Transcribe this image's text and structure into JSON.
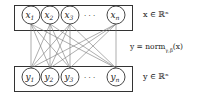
{
  "diagram": {
    "input_layer": {
      "nodes": [
        {
          "label": "x",
          "sub": "1"
        },
        {
          "label": "x",
          "sub": "2"
        },
        {
          "label": "x",
          "sub": "3"
        },
        {
          "label": "x",
          "sub": "n"
        }
      ],
      "ellipsis": "· · ·",
      "annotation": "x ∈ ℝⁿ"
    },
    "output_layer": {
      "nodes": [
        {
          "label": "y",
          "sub": "1"
        },
        {
          "label": "y",
          "sub": "2"
        },
        {
          "label": "y",
          "sub": "3"
        },
        {
          "label": "y",
          "sub": "n"
        }
      ],
      "ellipsis": "· · ·",
      "annotation": "y ∈ ℝⁿ"
    },
    "operation": "y = norm",
    "operation_sub": "γ,β",
    "operation_arg": "(x)",
    "colors": {
      "stroke": "#333333",
      "edge": "#666666",
      "background": "#ffffff"
    }
  }
}
